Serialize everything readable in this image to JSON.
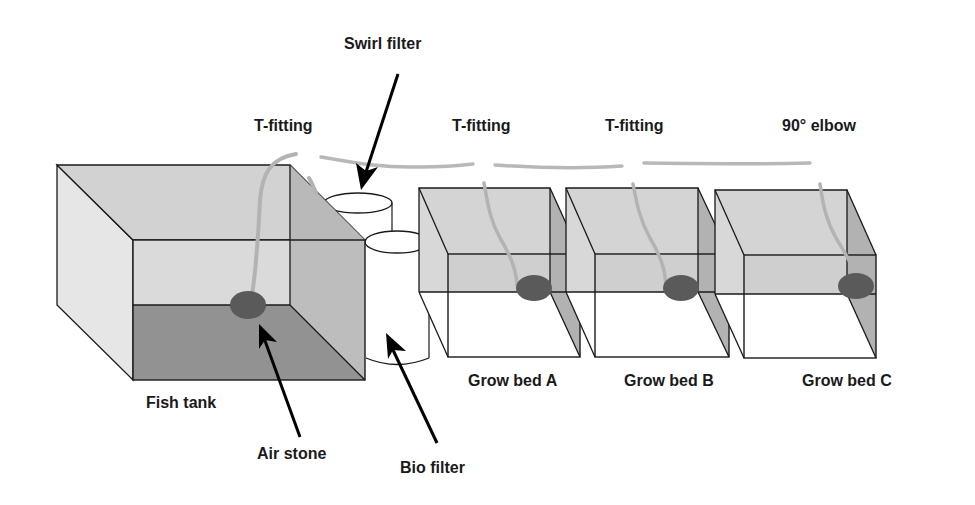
{
  "colors": {
    "background": "#ffffff",
    "outline": "#1a1a1a",
    "tank_back": "#d6d6d6",
    "tank_side": "#e4e4e4",
    "tank_right": "#b4b4b4",
    "water_bottom": "#8f8f8f",
    "bed_back": "#d3d3d3",
    "bed_right": "#b0b0b0",
    "bed_floor": "#ffffff",
    "air_stone": "#595959",
    "pipe": "#b5b5b5",
    "filter": "#ffffff"
  },
  "labels": {
    "swirl_filter": "Swirl filter",
    "t_fitting_1": "T-fitting",
    "t_fitting_2": "T-fitting",
    "t_fitting_3": "T-fitting",
    "elbow": "90° elbow",
    "fish_tank": "Fish tank",
    "air_stone": "Air stone",
    "bio_filter": "Bio filter",
    "grow_bed_a": "Grow bed A",
    "grow_bed_b": "Grow bed B",
    "grow_bed_c": "Grow bed C"
  },
  "components": [
    {
      "id": "fish-tank",
      "label": "Fish tank"
    },
    {
      "id": "swirl-filter",
      "label": "Swirl filter"
    },
    {
      "id": "bio-filter",
      "label": "Bio filter"
    },
    {
      "id": "grow-bed-a",
      "label": "Grow bed A"
    },
    {
      "id": "grow-bed-b",
      "label": "Grow bed B"
    },
    {
      "id": "grow-bed-c",
      "label": "Grow bed C"
    }
  ],
  "fittings": [
    "T-fitting",
    "T-fitting",
    "T-fitting",
    "90° elbow"
  ]
}
